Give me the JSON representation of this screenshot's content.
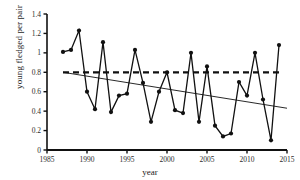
{
  "chart_data": {
    "type": "line",
    "title": "",
    "subtitle": "",
    "xlabel": "year",
    "ylabel": "young fledged per pair",
    "xlim": [
      1985,
      2015
    ],
    "ylim": [
      0,
      1.4
    ],
    "xticks": [
      1985,
      1990,
      1995,
      2000,
      2005,
      2010,
      2015
    ],
    "xtick_labels": [
      "1985",
      "1990",
      "1995",
      "2000",
      "2005",
      "2010",
      "2015"
    ],
    "yticks": [
      0,
      0.2,
      0.4,
      0.6,
      0.8,
      1.0,
      1.2,
      1.4
    ],
    "ytick_labels": [
      "0",
      "0.2",
      "0.4",
      "0.6",
      "0.8",
      "1",
      "1.2",
      "1.4"
    ],
    "grid": false,
    "legend": null,
    "marker": "filled-circle",
    "series": [
      {
        "name": "young fledged per pair",
        "x": [
          1987,
          1988,
          1989,
          1990,
          1991,
          1992,
          1993,
          1994,
          1995,
          1996,
          1997,
          1998,
          1999,
          2000,
          2001,
          2002,
          2003,
          2004,
          2005,
          2006,
          2007,
          2008,
          2009,
          2010,
          2011,
          2012,
          2013,
          2014
        ],
        "values": [
          1.01,
          1.03,
          1.23,
          0.6,
          0.42,
          1.11,
          0.39,
          0.56,
          0.58,
          1.03,
          0.69,
          0.29,
          0.6,
          0.8,
          0.41,
          0.38,
          1.0,
          0.29,
          0.86,
          0.25,
          0.14,
          0.17,
          0.7,
          0.56,
          1.0,
          0.52,
          0.1,
          1.08
        ]
      }
    ],
    "reference_line": {
      "name": "long-term mean",
      "style": "dashed",
      "value": 0.8,
      "x_start": 1987,
      "x_end": 2014
    },
    "trend_line": {
      "name": "linear trend",
      "style": "solid",
      "x_start": 1987,
      "y_start": 0.8,
      "x_end": 2015,
      "y_end": 0.43
    }
  }
}
